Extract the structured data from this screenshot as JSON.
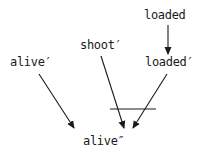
{
  "diagram": {
    "type": "dependency-graph",
    "nodes": [
      {
        "id": "loaded",
        "label": "loaded",
        "x": 144,
        "y": 9
      },
      {
        "id": "loaded_p",
        "label": "loaded′",
        "x": 145,
        "y": 56
      },
      {
        "id": "shoot_p",
        "label": "shoot′",
        "x": 80,
        "y": 39
      },
      {
        "id": "alive_p",
        "label": "alive′",
        "x": 10,
        "y": 56
      },
      {
        "id": "alive_pp",
        "label": "alive″",
        "x": 83,
        "y": 135
      }
    ],
    "edges": [
      {
        "from": "loaded",
        "to": "loaded_p"
      },
      {
        "from": "alive_p",
        "to": "alive_pp"
      },
      {
        "from": "shoot_p",
        "to": "alive_pp"
      },
      {
        "from": "loaded_p",
        "to": "alive_pp"
      }
    ],
    "annotations": [
      {
        "type": "horizontal-bar",
        "description": "bar joining shoot′ and loaded′ arrows into alive″"
      }
    ],
    "colors": {
      "stroke": "#1a1a1a",
      "background": "#ffffff"
    }
  }
}
